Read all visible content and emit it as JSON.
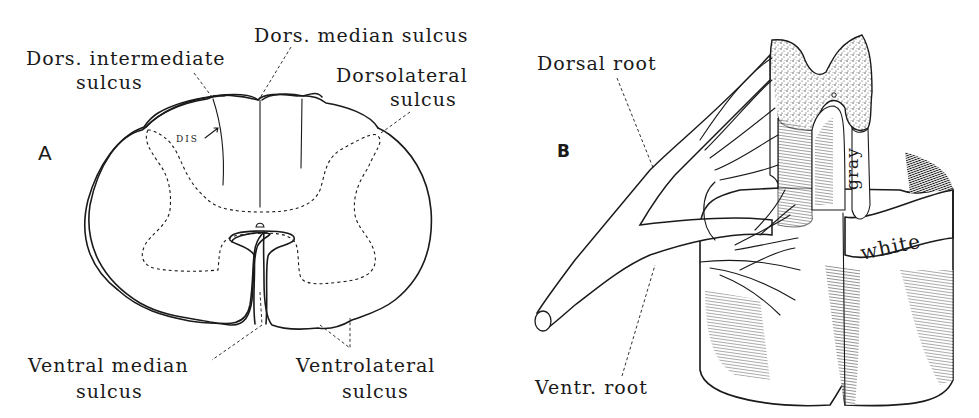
{
  "figure": {
    "panels": [
      {
        "id": "A",
        "letter": "A",
        "description": "Transverse section of spinal cord",
        "labels": {
          "dors_median": "Dors. median sulcus",
          "dors_intermediate_1": "Dors. intermediate",
          "dors_intermediate_2": "sulcus",
          "dorsolateral_1": "Dorsolateral",
          "dorsolateral_2": "sulcus",
          "dis": "DIS",
          "ventral_median_1": "Ventral median",
          "ventral_median_2": "sulcus",
          "ventrolateral_1": "Ventrolateral",
          "ventrolateral_2": "sulcus"
        }
      },
      {
        "id": "B",
        "letter": "B",
        "description": "Three-dimensional segment of spinal cord with roots",
        "labels": {
          "dorsal_root": "Dorsal root",
          "ventral_root": "Ventr. root",
          "gray": "gray",
          "white": "white"
        }
      }
    ],
    "colors": {
      "ink": "#1a1a1a",
      "paper": "#ffffff"
    }
  }
}
